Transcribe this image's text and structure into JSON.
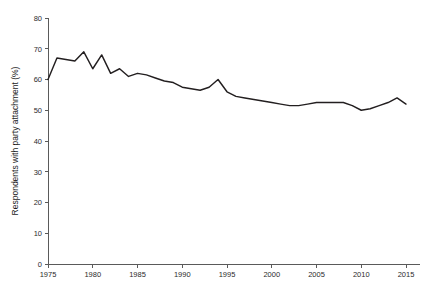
{
  "chart_data": {
    "type": "line",
    "title": "",
    "xlabel": "",
    "ylabel": "Respondents with party attachment (%)",
    "xlim": [
      1975,
      2015
    ],
    "ylim": [
      0,
      80
    ],
    "grid": false,
    "legend": "none",
    "xticks": [
      1975,
      1980,
      1985,
      1990,
      1995,
      2000,
      2005,
      2010,
      2015
    ],
    "yticks": [
      0,
      10,
      20,
      30,
      40,
      50,
      60,
      70,
      80
    ],
    "xtick_labels": [
      "1975",
      "1980",
      "1985",
      "1990",
      "1995",
      "2000",
      "2005",
      "2010",
      "2015"
    ],
    "ytick_labels": [
      "0",
      "10",
      "20",
      "30",
      "40",
      "50",
      "60",
      "70",
      "80"
    ],
    "series": [
      {
        "name": "Respondents with party attachment",
        "color": "#231f20",
        "x": [
          1975,
          1976,
          1977,
          1978,
          1979,
          1980,
          1981,
          1982,
          1983,
          1984,
          1985,
          1986,
          1987,
          1988,
          1989,
          1990,
          1991,
          1992,
          1993,
          1994,
          1995,
          1996,
          1997,
          1998,
          1999,
          2000,
          2001,
          2002,
          2003,
          2004,
          2005,
          2006,
          2007,
          2008,
          2009,
          2010,
          2011,
          2012,
          2013,
          2014,
          2015
        ],
        "values": [
          60.0,
          67.0,
          66.5,
          66.0,
          69.0,
          63.5,
          68.0,
          62.0,
          63.5,
          61.0,
          62.0,
          61.5,
          60.5,
          59.5,
          59.0,
          57.5,
          57.0,
          56.5,
          57.5,
          60.0,
          56.0,
          54.5,
          54.0,
          53.5,
          53.0,
          52.5,
          52.0,
          51.5,
          51.5,
          52.0,
          52.5,
          52.5,
          52.5,
          52.5,
          51.5,
          50.0,
          50.5,
          51.5,
          52.5,
          54.0,
          52.0
        ]
      }
    ]
  },
  "geometry": {
    "plot_left": 48,
    "plot_right": 406,
    "plot_top": 18,
    "plot_bottom": 264
  }
}
